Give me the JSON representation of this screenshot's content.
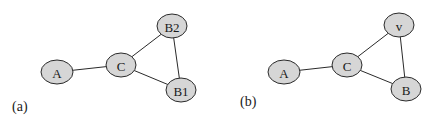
{
  "panels": [
    {
      "label": "(a)",
      "label_pos": [
        12,
        111
      ],
      "nodes": [
        {
          "id": "A",
          "label": "A",
          "cx": 57,
          "cy": 72,
          "rx": 16,
          "ry": 12
        },
        {
          "id": "C",
          "label": "C",
          "cx": 121,
          "cy": 65,
          "rx": 15,
          "ry": 12
        },
        {
          "id": "B2",
          "label": "B2",
          "cx": 172,
          "cy": 26,
          "rx": 15,
          "ry": 12
        },
        {
          "id": "B1",
          "label": "B1",
          "cx": 181,
          "cy": 90,
          "rx": 15,
          "ry": 12
        }
      ],
      "edges": [
        [
          "A",
          "C"
        ],
        [
          "C",
          "B2"
        ],
        [
          "C",
          "B1"
        ],
        [
          "B2",
          "B1"
        ]
      ]
    },
    {
      "label": "(b)",
      "label_pos": [
        240,
        106
      ],
      "nodes": [
        {
          "id": "A",
          "label": "A",
          "cx": 284,
          "cy": 72,
          "rx": 16,
          "ry": 12
        },
        {
          "id": "C",
          "label": "C",
          "cx": 347,
          "cy": 65,
          "rx": 15,
          "ry": 12
        },
        {
          "id": "v",
          "label": "v",
          "cx": 399,
          "cy": 25,
          "rx": 15,
          "ry": 12
        },
        {
          "id": "B",
          "label": "B",
          "cx": 406,
          "cy": 89,
          "rx": 15,
          "ry": 12
        }
      ],
      "edges": [
        [
          "A",
          "C"
        ],
        [
          "C",
          "v"
        ],
        [
          "C",
          "B"
        ],
        [
          "v",
          "B"
        ]
      ]
    }
  ],
  "colors": {
    "node_fill": "#d6d6d6",
    "node_stroke": "#2a2a2a",
    "edge": "#2a2a2a",
    "text": "#1a1a1a"
  }
}
